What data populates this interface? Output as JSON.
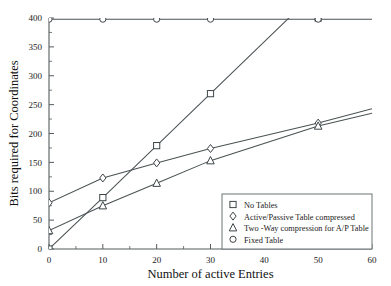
{
  "chart_data": {
    "type": "line",
    "title": "",
    "xlabel": "Number of active Entries",
    "ylabel": "Bits required for Coordinates",
    "xlim": [
      0,
      60
    ],
    "ylim": [
      0,
      400
    ],
    "xticks": [
      0,
      10,
      20,
      30,
      40,
      50,
      60
    ],
    "yticks": [
      0,
      50,
      100,
      150,
      200,
      250,
      300,
      350,
      400
    ],
    "xtick_labels": [
      "0",
      "10",
      "20",
      "30",
      "40",
      "50",
      "60"
    ],
    "ytick_labels": [
      "0",
      "50",
      "100",
      "150",
      "200",
      "250",
      "300",
      "350",
      "400"
    ],
    "grid": false,
    "legend_position": "bottom-right",
    "x": [
      0,
      10,
      20,
      30,
      50
    ],
    "series": [
      {
        "name": "No Tables",
        "marker": "square",
        "values": [
          0,
          89,
          179,
          269,
          400
        ]
      },
      {
        "name": "Active/Passive Table compressed",
        "marker": "diamond",
        "values": [
          80,
          123,
          149,
          174,
          218
        ]
      },
      {
        "name": "Two -Way compression for A/P Table",
        "marker": "triangle",
        "values": [
          32,
          75,
          114,
          153,
          213
        ]
      },
      {
        "name": "Fixed Table",
        "marker": "circle",
        "values": [
          398,
          398,
          398,
          398,
          398
        ]
      }
    ],
    "notes": {
      "no_tables_clip": "No Tables line continues past y=400 near x=44 and is clipped at the top frame",
      "two_way_extrapolated_end": 235,
      "active_passive_extrapolated_end": 243
    }
  },
  "legend": {
    "entries": [
      {
        "label": "No Tables",
        "marker": "square"
      },
      {
        "label": "Active/Passive Table compressed",
        "marker": "diamond"
      },
      {
        "label": "Two -Way compression for A/P Table",
        "marker": "triangle"
      },
      {
        "label": "Fixed Table",
        "marker": "circle"
      }
    ]
  },
  "colors": {
    "line": "#4a5254",
    "axis": "#555c5e",
    "marker_fill": "#ffffff",
    "background": "#ffffff"
  }
}
